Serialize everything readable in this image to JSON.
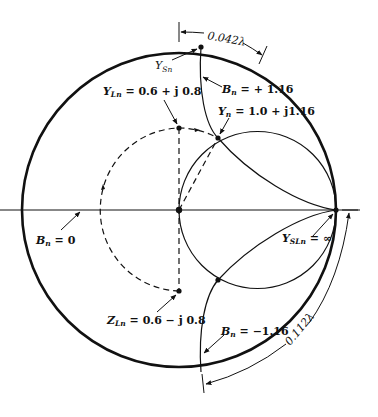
{
  "diagram": {
    "type": "smith-chart-single-stub-matching",
    "colors": {
      "ink": "#111111",
      "background": "#ffffff"
    },
    "labels": {
      "top_distance": "0.042λ",
      "y_sn_main": "Y",
      "y_sn_sub": "Sn",
      "b_pos_main": "B",
      "b_pos_sub": "n",
      "b_pos_value": " = + 1.16",
      "y_ln_main": "Y",
      "y_ln_sub": "Ln",
      "y_ln_value": " = 0.6 + j 0.8",
      "y_n_main": "Y",
      "y_n_sub": "n",
      "y_n_value": " = 1.0 + j1.16",
      "b_zero_main": "B",
      "b_zero_sub": "n",
      "b_zero_value": " = 0",
      "y_sln_main": "Y",
      "y_sln_sub": "SLn",
      "y_sln_value": " = ∞",
      "z_ln_main": "Z",
      "z_ln_sub": "Ln",
      "z_ln_value": " = 0.6 − j 0.8",
      "b_neg_main": "B",
      "b_neg_sub": "n",
      "b_neg_value": " = −1.16",
      "bottom_distance": "0.112λ"
    },
    "points": {
      "center": "normalized 1.0 (chart center)",
      "Y_Ln": "0.6 + j0.8",
      "Z_Ln": "0.6 - j0.8",
      "Y_n": "1.0 + j1.16",
      "Y_Sn": "short-stub input on outer circle, B = +1.16",
      "Y_SLn": "infinity (short circuit)"
    }
  }
}
